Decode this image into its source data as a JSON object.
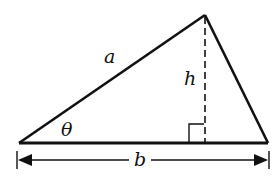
{
  "diagram": {
    "type": "triangle-area",
    "labels": {
      "side_a": "a",
      "height": "h",
      "angle": "θ",
      "base": "b"
    },
    "vertices": {
      "left": [
        19,
        143
      ],
      "apex": [
        205,
        15
      ],
      "right": [
        268,
        143
      ]
    },
    "colors": {
      "stroke": "#111111",
      "background": "#ffffff"
    }
  }
}
